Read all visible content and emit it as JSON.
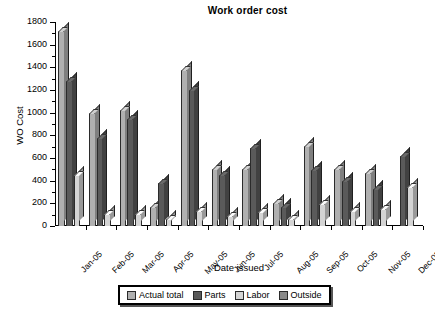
{
  "chart_data": {
    "type": "bar",
    "title": "Work order cost",
    "xlabel": "Date issued",
    "ylabel": "WO Cost",
    "ylim": [
      0,
      1800
    ],
    "ytick_step": 200,
    "yticks": [
      0,
      200,
      400,
      600,
      800,
      1000,
      1200,
      1400,
      1600,
      1800
    ],
    "grid": false,
    "legend_position": "bottom",
    "categories": [
      "Jan-05",
      "Feb-05",
      "Mar-05",
      "Apr-05",
      "May-05",
      "Jun-05",
      "Jul-05",
      "Aug-05",
      "Sep-05",
      "Oct-05",
      "Nov-05",
      "Dec-05"
    ],
    "series": [
      {
        "name": "Actual total",
        "color": "#b0b0b0",
        "values": [
          1720,
          1000,
          1020,
          170,
          1380,
          500,
          500,
          200,
          710,
          500,
          470,
          0
        ]
      },
      {
        "name": "Parts",
        "color": "#5a5a5a",
        "values": [
          1280,
          780,
          940,
          380,
          1200,
          450,
          690,
          170,
          490,
          400,
          330,
          620
        ]
      },
      {
        "name": "Labor",
        "color": "#d4d4d4",
        "values": [
          450,
          110,
          110,
          60,
          130,
          90,
          120,
          60,
          190,
          130,
          150,
          340
        ]
      },
      {
        "name": "Outside",
        "color": "#8a8a8a",
        "values": [
          0,
          0,
          0,
          0,
          0,
          0,
          0,
          0,
          0,
          0,
          0,
          0
        ]
      }
    ]
  },
  "chart": {
    "title": "Work order cost",
    "x_axis_title": "Date issued",
    "y_axis_title": "WO Cost"
  },
  "legend": {
    "items": [
      {
        "label": "Actual total"
      },
      {
        "label": "Parts"
      },
      {
        "label": "Labor"
      },
      {
        "label": "Outside"
      }
    ]
  }
}
